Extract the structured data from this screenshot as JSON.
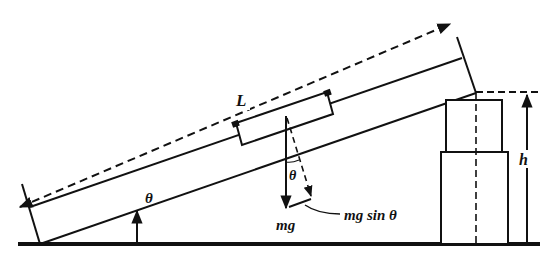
{
  "diagram": {
    "labels": {
      "length": "L",
      "height": "h",
      "angle_base": "θ",
      "angle_force": "θ",
      "weight": "mg",
      "component": "mg sin θ"
    },
    "colors": {
      "ink": "#111111",
      "background": "#ffffff"
    }
  }
}
